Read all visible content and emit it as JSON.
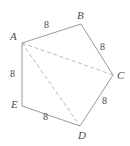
{
  "figure": {
    "type": "geometry-diagram",
    "shape_name": "pentagon ABCDE",
    "background_color": "#ffffff",
    "stroke_color": "#9a9a9a",
    "dashed_stroke_color": "#b0b0b0",
    "text_color": "#4a4a4a",
    "canvas": {
      "width": 130,
      "height": 146
    },
    "vertices": [
      {
        "name": "A",
        "label": "A",
        "x": 22,
        "y": 43,
        "label_x": 10,
        "label_y": 31
      },
      {
        "name": "B",
        "label": "B",
        "x": 81,
        "y": 24,
        "label_x": 77,
        "label_y": 10
      },
      {
        "name": "C",
        "label": "C",
        "x": 113,
        "y": 75,
        "label_x": 117,
        "label_y": 70
      },
      {
        "name": "D",
        "label": "D",
        "x": 80,
        "y": 126,
        "label_x": 78,
        "label_y": 130
      },
      {
        "name": "E",
        "label": "E",
        "x": 22,
        "y": 106,
        "label_x": 11,
        "label_y": 99
      }
    ],
    "edges": [
      {
        "name": "edge-AB",
        "from": "A",
        "to": "B",
        "style": "solid",
        "length_label": "8"
      },
      {
        "name": "edge-BC",
        "from": "B",
        "to": "C",
        "style": "solid",
        "length_label": "8"
      },
      {
        "name": "edge-CD",
        "from": "C",
        "to": "D",
        "style": "solid",
        "length_label": "8"
      },
      {
        "name": "edge-DE",
        "from": "D",
        "to": "E",
        "style": "solid",
        "length_label": "8"
      },
      {
        "name": "edge-EA",
        "from": "E",
        "to": "A",
        "style": "solid",
        "length_label": "8"
      }
    ],
    "diagonals": [
      {
        "name": "diagonal-AC",
        "from": "A",
        "to": "C",
        "style": "dashed"
      },
      {
        "name": "diagonal-AD",
        "from": "A",
        "to": "D",
        "style": "dashed"
      }
    ],
    "side_labels": [
      {
        "name": "side-label-AB",
        "text": "8",
        "x": 44,
        "y": 20
      },
      {
        "name": "side-label-BC",
        "text": "8",
        "x": 100,
        "y": 42
      },
      {
        "name": "side-label-CD",
        "text": "8",
        "x": 102,
        "y": 96
      },
      {
        "name": "side-label-DE",
        "text": "8",
        "x": 43,
        "y": 112
      },
      {
        "name": "side-label-EA",
        "text": "8",
        "x": 10,
        "y": 69
      }
    ]
  }
}
